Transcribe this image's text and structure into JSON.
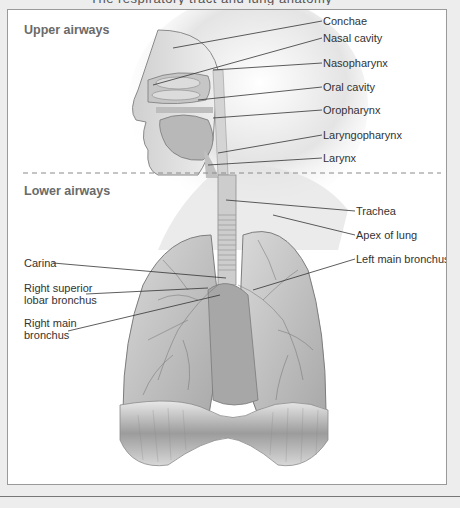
{
  "title_partial": "The respiratory tract and lung anatomy",
  "sections": {
    "upper": "Upper airways",
    "lower": "Lower airways"
  },
  "labels_right_upper": [
    {
      "text": "Conchae"
    },
    {
      "text": "Nasal cavity"
    },
    {
      "text": "Nasopharynx"
    },
    {
      "text": "Oral cavity"
    },
    {
      "text": "Oropharynx"
    },
    {
      "text": "Laryngopharynx"
    },
    {
      "text": "Larynx"
    }
  ],
  "labels_right_lower": [
    {
      "text": "Trachea"
    },
    {
      "text": "Apex of lung"
    },
    {
      "text": "Left main bronchus"
    }
  ],
  "labels_left_lower": [
    {
      "line1": "Carina",
      "line2": ""
    },
    {
      "line1": "Right superior",
      "line2": "lobar bronchus"
    },
    {
      "line1": "Right main",
      "line2": "bronchus"
    }
  ],
  "colors": {
    "background": "#ededed",
    "panel": "#ffffff",
    "border": "#9a9a9a",
    "section_heading": "#6a6a6a",
    "label_text": "#333333",
    "divider": "#8a8a8a"
  }
}
